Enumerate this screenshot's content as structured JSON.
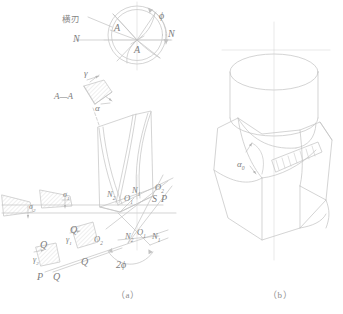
{
  "figure": {
    "type": "engineering-line-drawing",
    "stroke_color": "#bdbdbd",
    "label_color": "#7d7d7d",
    "background": "#ffffff"
  },
  "captions": {
    "a": "（a）",
    "b": "（b）"
  },
  "annotations": {
    "chisel_edge_cjk": "横刃",
    "A_upper": "A",
    "A_lower": "A",
    "N_left": "N",
    "N_right": "N",
    "phi": "ϕ",
    "section_label": "A—A",
    "gamma": "γ",
    "alpha": "α",
    "sigma1": "σ",
    "sigma1_sub": "1",
    "sigma2": "σ",
    "sigma2_sub": "2",
    "gamma1": "γ",
    "gamma1_sub": "1",
    "gamma2": "γ",
    "gamma2_sub": "2",
    "two_phi": "2ϕ",
    "alpha0": "α",
    "alpha0_sub": "0",
    "P_left": "P",
    "P_right": "P",
    "S": "S",
    "Q_a": "Q",
    "Q_b": "Q",
    "Q_c": "Q",
    "Q_d": "Q",
    "Q_e": "Q",
    "N1_upper": "N",
    "N1_upper_sub": "1",
    "N2_upper": "N",
    "N2_upper_sub": "2",
    "O1_upper": "O",
    "O1_upper_sub": "1",
    "O2_upper": "O",
    "O2_upper_sub": "2",
    "N1_lower": "N",
    "N1_lower_sub": "1",
    "N2_lower": "N",
    "N2_lower_sub": "2",
    "O1_lower": "O",
    "O1_lower_sub": "1",
    "O2_lower": "O",
    "O2_lower_sub": "2"
  }
}
